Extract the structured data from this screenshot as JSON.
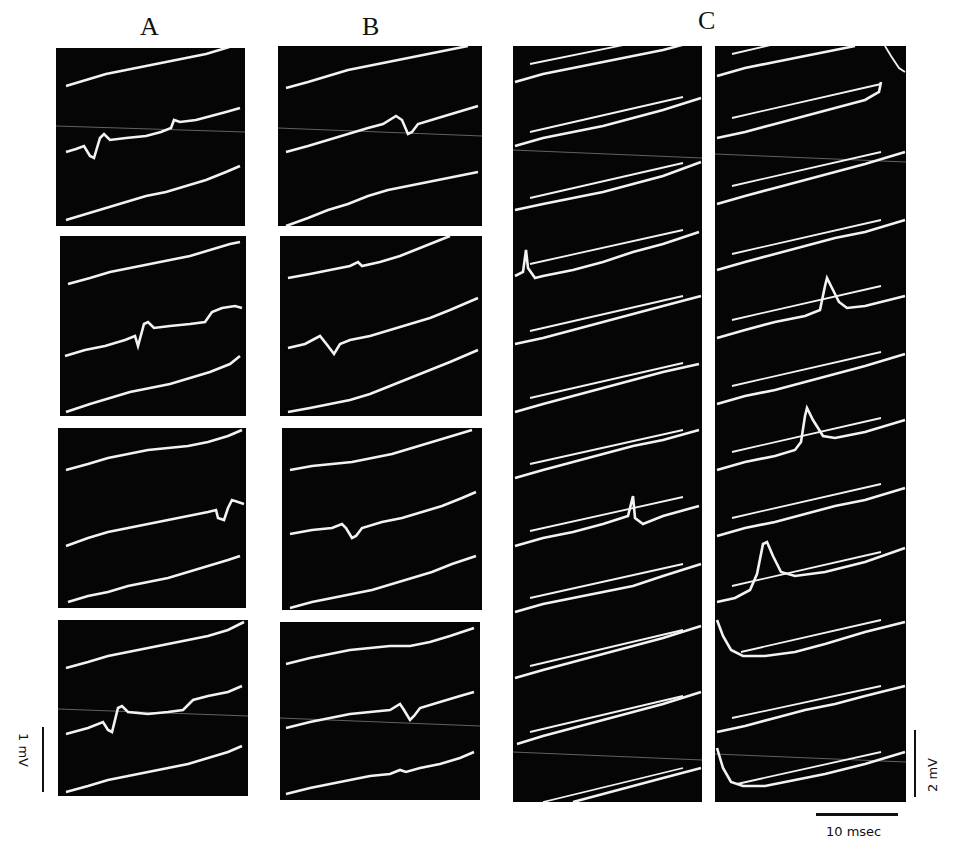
{
  "figure": {
    "column_labels": [
      "A",
      "B",
      "C"
    ],
    "panels": {
      "A": {
        "frames": 4,
        "traces_per_frame": 3,
        "event_trace": "middle"
      },
      "B": {
        "frames": 4,
        "traces_per_frame": 3,
        "event_trace": "middle"
      },
      "C": {
        "strips": 2,
        "sweeps_per_strip": 10,
        "has_reference_lines": true
      }
    },
    "scale_bars": {
      "voltage_left": "1 mV",
      "voltage_right": "2 mV",
      "time": "10 msec"
    },
    "colors": {
      "background": "#ffffff",
      "screen": "#050505",
      "trace": "#f2f2f2",
      "text": "#111111"
    }
  },
  "caption_fragment": "(caption text below is cropped; only tops of glyphs visible)"
}
